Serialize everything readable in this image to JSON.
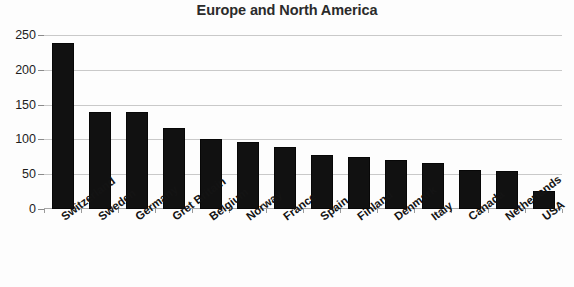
{
  "chart_data": {
    "type": "bar",
    "title": "Europe and North America",
    "xlabel": "",
    "ylabel": "",
    "ylim": [
      0,
      250
    ],
    "yticks": [
      0,
      50,
      100,
      150,
      200,
      250
    ],
    "grid": true,
    "legend": false,
    "bar_color": "#111111",
    "categories": [
      "Switzerland",
      "Sweden",
      "Germany",
      "Gret Britain",
      "Belgium",
      "Norway",
      "France",
      "Spain",
      "Finland",
      "Denmark",
      "Italy",
      "Canada",
      "Netherlands",
      "USA"
    ],
    "values": [
      238,
      139,
      139,
      117,
      100,
      97,
      89,
      78,
      75,
      70,
      66,
      56,
      54,
      26
    ]
  }
}
